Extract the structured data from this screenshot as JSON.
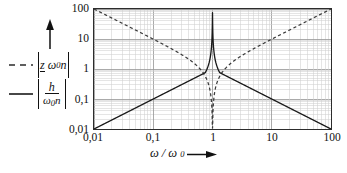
{
  "chart_data": {
    "type": "line",
    "title": "",
    "xlabel": "ω/ω₀",
    "ylabel": "",
    "xscale": "log",
    "yscale": "log",
    "xlim": [
      0.01,
      100
    ],
    "ylim": [
      0.01,
      100
    ],
    "grid": true,
    "grid_minor": true,
    "legend_position": "outside-left",
    "xticks": [
      "0,01",
      "0,1",
      "1",
      "10",
      "100"
    ],
    "xtick_values": [
      0.01,
      0.1,
      1,
      10,
      100
    ],
    "yticks": [
      "100",
      "10",
      "1",
      "0,1",
      "0,01"
    ],
    "ytick_values": [
      100,
      10,
      1,
      0.1,
      0.01
    ],
    "series": [
      {
        "name": "|z ω₀n|",
        "style": "dashed",
        "color": "#3a3a3a",
        "description": "Impedance magnitude: falls as 1/x from 100 at x=0,01, dips to a sharp minimum at x=1, rises as x to 100 at x=100",
        "x": [
          0.01,
          0.0178,
          0.0316,
          0.0562,
          0.1,
          0.178,
          0.316,
          0.562,
          0.75,
          0.9,
          0.96,
          0.99,
          1.0,
          1.01,
          1.04,
          1.1,
          1.33,
          1.78,
          3.16,
          5.62,
          10,
          17.8,
          31.6,
          56.2,
          100
        ],
        "y": [
          100,
          56.2,
          31.6,
          17.8,
          10,
          5.62,
          3.16,
          1.78,
          1.33,
          1.11,
          1.04,
          1.01,
          0.012,
          1.01,
          1.04,
          1.1,
          1.33,
          1.78,
          3.16,
          5.62,
          10,
          17.8,
          31.6,
          56.2,
          100
        ]
      },
      {
        "name": "|h/(ω₀n)|",
        "style": "solid",
        "color": "#1a1a1a",
        "description": "Admittance magnitude: rises as x from 0,01 at x=0,01, sharp resonance peak at x=1, falls as 1/x to 0,01 at x=100",
        "x": [
          0.01,
          0.0178,
          0.0316,
          0.0562,
          0.1,
          0.178,
          0.316,
          0.562,
          0.75,
          0.9,
          0.96,
          0.99,
          1.0,
          1.01,
          1.04,
          1.1,
          1.33,
          1.78,
          3.16,
          5.62,
          10,
          17.8,
          31.6,
          56.2,
          100
        ],
        "y": [
          0.01,
          0.0178,
          0.0316,
          0.0562,
          0.1,
          0.178,
          0.316,
          0.562,
          0.75,
          0.9,
          0.96,
          0.99,
          80,
          0.99,
          0.96,
          0.9,
          0.75,
          0.562,
          0.316,
          0.178,
          0.1,
          0.0562,
          0.0316,
          0.0178,
          0.01
        ]
      }
    ],
    "annotations": [
      {
        "name": "y-axis-direction-arrow",
        "text": ""
      },
      {
        "name": "x-axis-direction-arrow",
        "text": ""
      }
    ]
  },
  "axes": {
    "y_ticks": [
      {
        "label": "100",
        "value": 100
      },
      {
        "label": "10",
        "value": 10
      },
      {
        "label": "1",
        "value": 1
      },
      {
        "label": "0,1",
        "value": 0.1
      },
      {
        "label": "0,01",
        "value": 0.01
      }
    ],
    "x_ticks": [
      {
        "label": "0,01",
        "value": 0.01
      },
      {
        "label": "0,1",
        "value": 0.1
      },
      {
        "label": "1",
        "value": 1
      },
      {
        "label": "10",
        "value": 10
      },
      {
        "label": "100",
        "value": 100
      }
    ],
    "x_title": {
      "omega": "ω",
      "slash": "/",
      "omega0_base": "ω",
      "omega0_sub": "0"
    }
  },
  "legend": {
    "entries": [
      {
        "style": "dashed",
        "bar_open": "|",
        "z": "z",
        "omega": "ω",
        "omega_sub": "0",
        "n": "n",
        "bar_close": "|",
        "plain": "|z ω₀n|"
      },
      {
        "style": "solid",
        "bar_open": "|",
        "numerator": "h",
        "den_omega": "ω",
        "den_sub": "0",
        "den_n": "n",
        "bar_close": "|",
        "plain": "|h/(ω₀n)|"
      }
    ]
  },
  "colors": {
    "frame": "#2c2c2c",
    "grid_major": "#9a9a9a",
    "grid_minor": "#cfcfcf",
    "curve_solid": "#1a1a1a",
    "curve_dashed": "#3a3a3a",
    "text": "#111111",
    "background": "#ffffff"
  }
}
